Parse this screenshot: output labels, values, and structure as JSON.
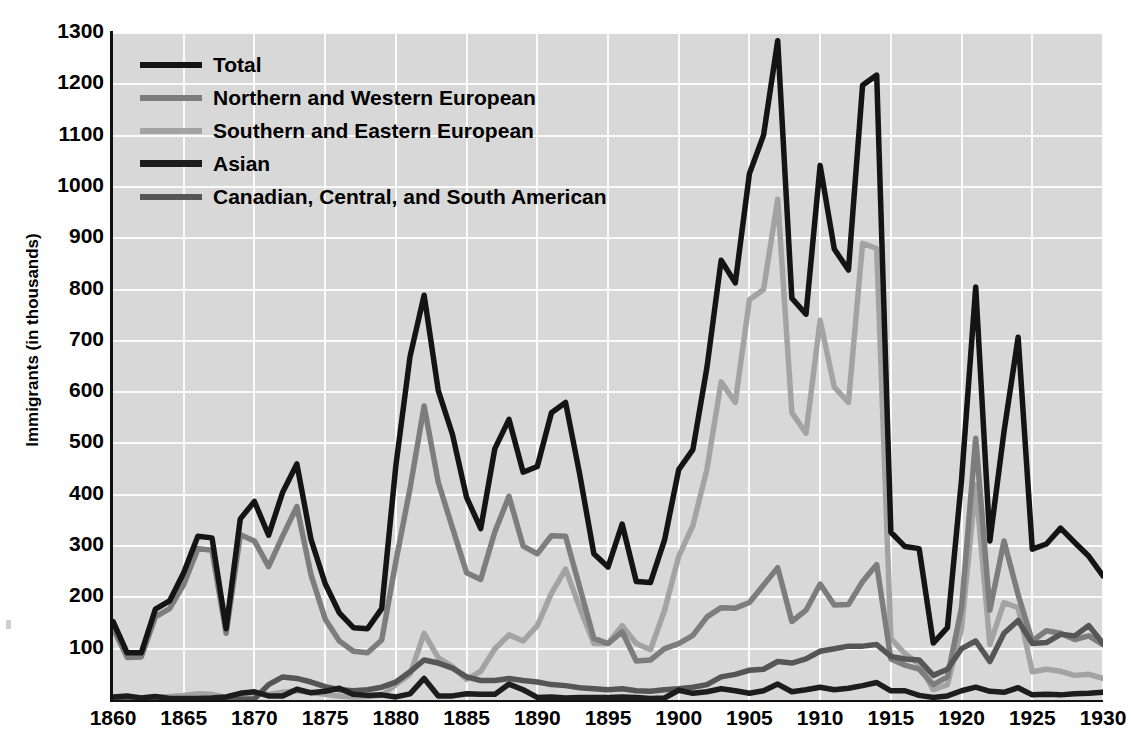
{
  "chart_data": {
    "type": "line",
    "title": "",
    "xlabel": "",
    "ylabel": "Immigrants (in thousands)",
    "xlim": [
      1860,
      1930
    ],
    "ylim": [
      0,
      1300
    ],
    "grid": true,
    "legend_position": "top-left",
    "xticks": [
      1860,
      1865,
      1870,
      1875,
      1880,
      1885,
      1890,
      1895,
      1900,
      1905,
      1910,
      1915,
      1920,
      1925,
      1930
    ],
    "yticks": [
      100,
      200,
      300,
      400,
      500,
      600,
      700,
      800,
      900,
      1000,
      1100,
      1200,
      1300
    ],
    "x": [
      1860,
      1861,
      1862,
      1863,
      1864,
      1865,
      1866,
      1867,
      1868,
      1869,
      1870,
      1871,
      1872,
      1873,
      1874,
      1875,
      1876,
      1877,
      1878,
      1879,
      1880,
      1881,
      1882,
      1883,
      1884,
      1885,
      1886,
      1887,
      1888,
      1889,
      1890,
      1891,
      1892,
      1893,
      1894,
      1895,
      1896,
      1897,
      1898,
      1899,
      1900,
      1901,
      1902,
      1903,
      1904,
      1905,
      1906,
      1907,
      1908,
      1909,
      1910,
      1911,
      1912,
      1913,
      1914,
      1915,
      1916,
      1917,
      1918,
      1919,
      1920,
      1921,
      1922,
      1923,
      1924,
      1925,
      1926,
      1927,
      1928,
      1929,
      1930
    ],
    "series": [
      {
        "name": "Total",
        "color": "#141414",
        "values": [
          153,
          92,
          92,
          177,
          193,
          248,
          319,
          316,
          139,
          353,
          387,
          321,
          405,
          460,
          313,
          227,
          170,
          141,
          139,
          178,
          457,
          669,
          789,
          603,
          518,
          395,
          334,
          490,
          547,
          444,
          455,
          560,
          580,
          440,
          285,
          259,
          343,
          231,
          229,
          312,
          449,
          488,
          649,
          857,
          813,
          1026,
          1101,
          1285,
          783,
          752,
          1042,
          879,
          838,
          1198,
          1218,
          327,
          299,
          295,
          111,
          141,
          430,
          805,
          310,
          523,
          707,
          294,
          304,
          335,
          307,
          280,
          242
        ]
      },
      {
        "name": "Northern and Western European",
        "color": "#7d7d7d",
        "values": [
          140,
          83,
          84,
          162,
          178,
          225,
          295,
          292,
          130,
          322,
          310,
          260,
          320,
          377,
          244,
          158,
          115,
          95,
          92,
          117,
          270,
          412,
          573,
          424,
          336,
          248,
          235,
          328,
          397,
          300,
          285,
          320,
          319,
          220,
          120,
          110,
          133,
          76,
          78,
          100,
          110,
          126,
          162,
          180,
          179,
          190,
          224,
          258,
          153,
          175,
          226,
          185,
          186,
          231,
          264,
          80,
          68,
          60,
          30,
          45,
          180,
          510,
          175,
          310,
          205,
          115,
          135,
          130,
          118,
          125,
          108
        ]
      },
      {
        "name": "Southern and Eastern European",
        "color": "#a3a3a3",
        "values": [
          6,
          4,
          4,
          6,
          7,
          9,
          12,
          11,
          5,
          13,
          14,
          11,
          15,
          18,
          15,
          11,
          8,
          6,
          7,
          9,
          30,
          50,
          130,
          82,
          65,
          40,
          56,
          100,
          127,
          115,
          145,
          208,
          255,
          180,
          110,
          110,
          145,
          110,
          98,
          175,
          280,
          340,
          450,
          620,
          580,
          780,
          800,
          976,
          560,
          520,
          740,
          610,
          580,
          890,
          880,
          120,
          90,
          70,
          20,
          30,
          140,
          420,
          108,
          190,
          180,
          55,
          60,
          56,
          48,
          50,
          42
        ]
      },
      {
        "name": "Asian",
        "color": "#1d1d1d",
        "values": [
          6,
          8,
          4,
          7,
          3,
          3,
          3,
          4,
          6,
          13,
          16,
          8,
          8,
          21,
          14,
          17,
          23,
          11,
          9,
          10,
          6,
          12,
          42,
          8,
          8,
          12,
          11,
          11,
          31,
          20,
          5,
          6,
          4,
          5,
          5,
          5,
          6,
          5,
          3,
          4,
          19,
          13,
          16,
          22,
          18,
          13,
          18,
          31,
          16,
          20,
          25,
          20,
          23,
          28,
          34,
          18,
          18,
          9,
          5,
          8,
          18,
          25,
          17,
          15,
          24,
          10,
          11,
          10,
          12,
          13,
          15
        ]
      },
      {
        "name": "Canadian, Central, and South American",
        "color": "#565656",
        "values": [
          1,
          1,
          1,
          1,
          1,
          1,
          1,
          1,
          1,
          2,
          2,
          30,
          45,
          42,
          35,
          26,
          20,
          18,
          20,
          25,
          35,
          55,
          78,
          72,
          62,
          45,
          38,
          38,
          42,
          38,
          35,
          30,
          28,
          24,
          22,
          20,
          22,
          18,
          17,
          20,
          22,
          25,
          30,
          45,
          50,
          58,
          60,
          75,
          72,
          80,
          95,
          100,
          105,
          105,
          108,
          85,
          80,
          78,
          48,
          60,
          100,
          115,
          75,
          130,
          155,
          110,
          112,
          128,
          125,
          145,
          110
        ]
      }
    ]
  },
  "axes": {
    "y_title": "Immigrants (in thousands)",
    "y_tick_labels": [
      "1300",
      "1200",
      "1100",
      "1000",
      "900",
      "800",
      "700",
      "600",
      "500",
      "400",
      "300",
      "200",
      "100"
    ],
    "x_tick_labels": [
      "1860",
      "1865",
      "1870",
      "1875",
      "1880",
      "1885",
      "1890",
      "1895",
      "1900",
      "1905",
      "1910",
      "1915",
      "1920",
      "1925",
      "1930"
    ]
  },
  "legend": {
    "items": [
      {
        "label": "Total",
        "color": "#141414",
        "thickness": 6
      },
      {
        "label": "Northern and Western European",
        "color": "#7d7d7d",
        "thickness": 6
      },
      {
        "label": "Southern and Eastern European",
        "color": "#a3a3a3",
        "thickness": 6
      },
      {
        "label": "Asian",
        "color": "#1d1d1d",
        "thickness": 7
      },
      {
        "label": "Canadian, Central, and South American",
        "color": "#565656",
        "thickness": 6
      }
    ]
  },
  "style": {
    "plot_background": "#d8d8d8",
    "gridline_color": "#fbfbfb",
    "axis_color": "#111111",
    "page_background": "#ffffff"
  }
}
